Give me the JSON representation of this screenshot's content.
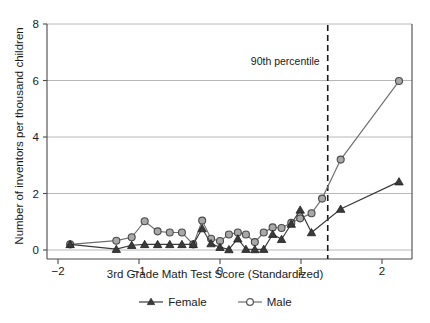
{
  "chart_data": {
    "type": "line",
    "title": "",
    "xlabel": "3rd Grade Math Test Score (Standardized)",
    "ylabel": "Number of inventors per thousand children",
    "xlim": [
      -2.45,
      2.55
    ],
    "ylim": [
      -0.35,
      8.6
    ],
    "xticks": [
      -2,
      -1,
      0,
      1,
      2
    ],
    "xticklabels": [
      "−2",
      "−1",
      "0",
      "1",
      "2"
    ],
    "yticks": [
      0,
      2,
      4,
      6,
      8
    ],
    "yticklabels": [
      "0",
      "2",
      "4",
      "6",
      "8"
    ],
    "grid": "horizontal",
    "legend_position": "below",
    "annotations": [
      {
        "text": "90th percentile",
        "x": 1.33,
        "y": 6.55,
        "type": "vline-label"
      }
    ],
    "reference_lines": [
      {
        "orientation": "vertical",
        "x": 1.33,
        "style": "dashed",
        "label": "90th percentile"
      }
    ],
    "series": [
      {
        "name": "Female",
        "marker": "filled-triangle",
        "color": "#3a3a3a",
        "points": [
          {
            "x": -1.85,
            "y": 0.2
          },
          {
            "x": -1.28,
            "y": 0.03
          },
          {
            "x": -1.09,
            "y": 0.17
          },
          {
            "x": -0.93,
            "y": 0.2
          },
          {
            "x": -0.77,
            "y": 0.2
          },
          {
            "x": -0.62,
            "y": 0.2
          },
          {
            "x": -0.47,
            "y": 0.2
          },
          {
            "x": -0.33,
            "y": 0.2
          },
          {
            "x": -0.22,
            "y": 0.76
          },
          {
            "x": -0.11,
            "y": 0.23
          },
          {
            "x": 0.0,
            "y": 0.1
          },
          {
            "x": 0.11,
            "y": 0.02
          },
          {
            "x": 0.22,
            "y": 0.4
          },
          {
            "x": 0.32,
            "y": 0.03
          },
          {
            "x": 0.43,
            "y": 0.02
          },
          {
            "x": 0.54,
            "y": 0.03
          },
          {
            "x": 0.65,
            "y": 0.56
          },
          {
            "x": 0.76,
            "y": 0.38
          },
          {
            "x": 0.88,
            "y": 0.92
          },
          {
            "x": 0.99,
            "y": 1.42
          },
          {
            "x": 1.13,
            "y": 0.62
          },
          {
            "x": 1.49,
            "y": 1.45
          },
          {
            "x": 2.21,
            "y": 2.42
          }
        ]
      },
      {
        "name": "Male",
        "marker": "open-circle",
        "color": "#808080",
        "points": [
          {
            "x": -1.85,
            "y": 0.2
          },
          {
            "x": -1.28,
            "y": 0.33
          },
          {
            "x": -1.09,
            "y": 0.45
          },
          {
            "x": -0.93,
            "y": 1.02
          },
          {
            "x": -0.77,
            "y": 0.66
          },
          {
            "x": -0.62,
            "y": 0.62
          },
          {
            "x": -0.47,
            "y": 0.62
          },
          {
            "x": -0.33,
            "y": 0.2
          },
          {
            "x": -0.22,
            "y": 1.04
          },
          {
            "x": -0.11,
            "y": 0.4
          },
          {
            "x": 0.0,
            "y": 0.32
          },
          {
            "x": 0.11,
            "y": 0.55
          },
          {
            "x": 0.22,
            "y": 0.62
          },
          {
            "x": 0.32,
            "y": 0.55
          },
          {
            "x": 0.43,
            "y": 0.28
          },
          {
            "x": 0.54,
            "y": 0.62
          },
          {
            "x": 0.65,
            "y": 0.8
          },
          {
            "x": 0.76,
            "y": 0.78
          },
          {
            "x": 0.88,
            "y": 0.96
          },
          {
            "x": 0.99,
            "y": 1.12
          },
          {
            "x": 1.13,
            "y": 1.3
          },
          {
            "x": 1.26,
            "y": 1.82
          },
          {
            "x": 1.49,
            "y": 3.2
          },
          {
            "x": 2.21,
            "y": 5.98
          }
        ]
      }
    ]
  },
  "legend": {
    "entries": [
      {
        "label": "Female",
        "marker": "filled-triangle"
      },
      {
        "label": "Male",
        "marker": "open-circle"
      }
    ]
  },
  "colors": {
    "female": "#3a3a3a",
    "male": "#808080",
    "grid": "#b0b0b0",
    "axis": "#4a4a4a",
    "text": "#1a1a1a"
  }
}
